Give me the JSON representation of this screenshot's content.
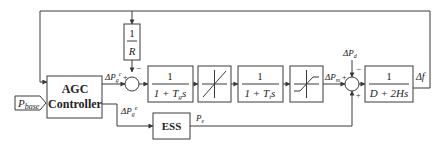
{
  "diagram": {
    "type": "block-diagram",
    "title": "",
    "blocks": {
      "agc": {
        "line1": "AGC",
        "line2": "Controller"
      },
      "pbase": {
        "label": "P",
        "sub": "base"
      },
      "droop": {
        "num": "1",
        "den": "R"
      },
      "governor": {
        "num": "1",
        "den_prefix": "1 + T",
        "den_sub": "g",
        "den_suffix": "s"
      },
      "rate_limiter": {
        "kind": "linear"
      },
      "turbine": {
        "num": "1",
        "den_prefix": "1 + T",
        "den_sub": "t",
        "den_suffix": "s"
      },
      "saturation": {
        "kind": "saturation"
      },
      "system": {
        "num": "1",
        "den": "D + 2Hs"
      },
      "ess": {
        "label": "ESS"
      }
    },
    "signals": {
      "dpg_c_top": {
        "main": "ΔP",
        "sub": "g",
        "sup": "c"
      },
      "dpg_e_bot": {
        "main": "ΔP",
        "sub": "g",
        "sup": "e"
      },
      "dpm": {
        "main": "ΔP",
        "sub": "m"
      },
      "dpd": {
        "main": "ΔP",
        "sub": "d"
      },
      "pe": {
        "main": "P",
        "sub": "e"
      },
      "df": {
        "main": "Δf"
      }
    },
    "signs": {
      "sum1_left": "+",
      "sum1_top": "−",
      "sum2_left": "+",
      "sum2_top": "−",
      "sum2_bottom": "+"
    },
    "colors": {
      "stroke": "#3a3a3a",
      "text": "#222222",
      "background": "#ffffff"
    }
  }
}
